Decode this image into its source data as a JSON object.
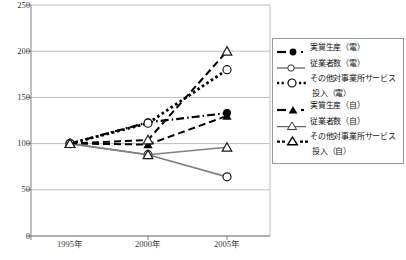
{
  "chart_data": {
    "type": "line",
    "title": "",
    "xlabel": "",
    "ylabel": "",
    "x": [
      "1995年",
      "2000年",
      "2005年"
    ],
    "categories": [
      "1995年",
      "2000年",
      "2005年"
    ],
    "ylim": [
      0,
      250
    ],
    "yticks": [
      0,
      50,
      100,
      150,
      200,
      250
    ],
    "ytick_labels": [
      "0",
      "50",
      "100",
      "150",
      "200",
      "250"
    ],
    "grid": "horizontal",
    "legend_position": "right",
    "series": [
      {
        "name": "実質生産（電）",
        "values": [
          100,
          123,
          133
        ],
        "marker": "filled-circle",
        "line": "dash-dot",
        "color": "#000000"
      },
      {
        "name": "従業者数（電）",
        "values": [
          100,
          88,
          64
        ],
        "marker": "open-circle",
        "line": "solid",
        "color": "#808080"
      },
      {
        "name": "その他対事業所サービス投入（電）",
        "name_line1": "その他対事業所サービス",
        "name_line2": "投入（電）",
        "values": [
          100,
          122,
          180
        ],
        "marker": "open-circle",
        "line": "dotted",
        "color": "#000000"
      },
      {
        "name": "実質生産（自）",
        "values": [
          100,
          99,
          130
        ],
        "marker": "filled-triangle",
        "line": "dashed",
        "color": "#000000"
      },
      {
        "name": "従業者数（自）",
        "values": [
          100,
          88,
          96
        ],
        "marker": "open-triangle",
        "line": "solid",
        "color": "#808080"
      },
      {
        "name": "その他対事業所サービス投入（自）",
        "name_line1": "その他対事業所サービス",
        "name_line2": "投入（自）",
        "values": [
          100,
          104,
          200
        ],
        "marker": "open-triangle",
        "line": "dashed",
        "color": "#000000"
      }
    ]
  },
  "axis": {
    "y_labels": [
      "250",
      "200",
      "150",
      "100",
      "50",
      "0"
    ],
    "x_labels": [
      "1995年",
      "2000年",
      "2005年"
    ]
  },
  "colors": {
    "grid": "#bfbfbf",
    "axis": "#808080",
    "series_black": "#000000",
    "series_gray": "#808080",
    "legend_border": "#9a9a9a"
  }
}
